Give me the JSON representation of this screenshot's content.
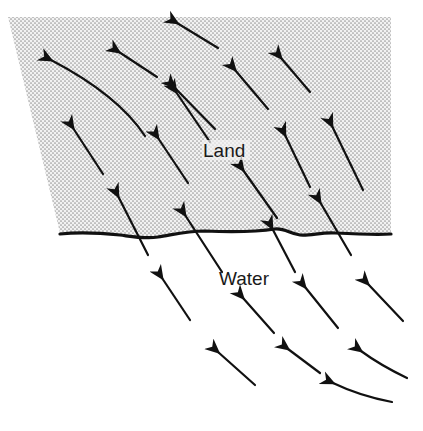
{
  "diagram": {
    "labels": {
      "land": "Land",
      "water": "Water"
    },
    "colors": {
      "land_dots": "#9a9a9a",
      "land_bg": "#f2f2f2",
      "water_bg": "#ffffff",
      "arrow": "#111111",
      "coastline": "#111111"
    },
    "regions": [
      {
        "name": "land",
        "pattern": "stippled"
      },
      {
        "name": "water",
        "pattern": "blank"
      }
    ],
    "arrow_direction": "from lower-right (water) toward upper-left (land)",
    "arrow_count": 22
  }
}
